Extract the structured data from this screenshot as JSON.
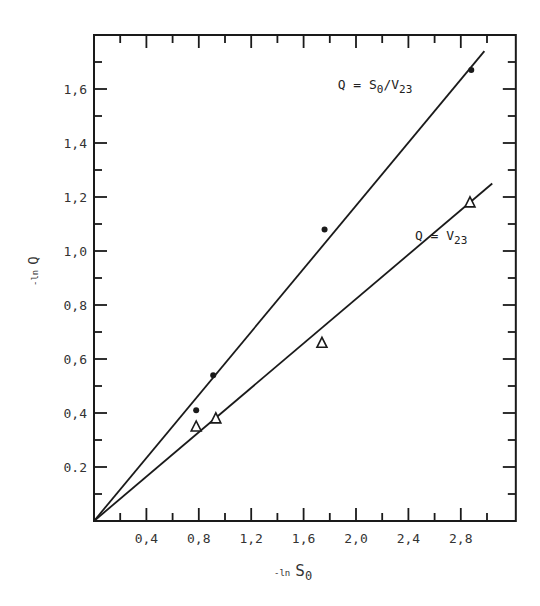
{
  "chart_data": {
    "type": "scatter",
    "title": "",
    "xlabel": "-ln S0",
    "ylabel": "-ln Q",
    "xlabel_parts": {
      "prefix": "-ln",
      "main": "S",
      "sub": "0"
    },
    "ylabel_parts": {
      "prefix": "-ln",
      "main": "Q"
    },
    "xlim": [
      0,
      3.22
    ],
    "ylim": [
      0,
      1.8
    ],
    "grid": false,
    "legend": "inline labels",
    "x_ticks": [
      0.4,
      0.8,
      1.2,
      1.6,
      2.0,
      2.4,
      2.8
    ],
    "x_tick_labels": [
      "0,4",
      "0,8",
      "1,2",
      "1,6",
      "2,0",
      "2,4",
      "2,8"
    ],
    "x_minor_ticks": [
      0.2,
      0.6,
      1.0,
      1.4,
      1.8,
      2.2,
      2.6,
      3.0
    ],
    "y_ticks": [
      0.2,
      0.4,
      0.6,
      0.8,
      1.0,
      1.2,
      1.4,
      1.6
    ],
    "y_tick_labels": [
      "0.2",
      "0,4",
      "0,6",
      "0,8",
      "1,0",
      "1,2",
      "1,4",
      "1,6"
    ],
    "y_minor_ticks": [
      0.1,
      0.3,
      0.5,
      0.7,
      0.9,
      1.1,
      1.3,
      1.5,
      1.7
    ],
    "series": [
      {
        "name": "Q = S0/V23",
        "label_parts": {
          "prefix": "Q = S",
          "sub1": "0",
          "mid": "/V",
          "sub2": "23"
        },
        "marker": "filled-circle",
        "x": [
          0.78,
          0.91,
          1.76,
          2.88
        ],
        "y": [
          0.41,
          0.54,
          1.08,
          1.67
        ],
        "fit_line": {
          "x": [
            0,
            2.98
          ],
          "y": [
            0,
            1.74
          ]
        },
        "label_pos": {
          "x": 1.86,
          "y": 1.6
        }
      },
      {
        "name": "Q = V23",
        "label_parts": {
          "prefix": "Q = V",
          "sub1": "",
          "mid": "",
          "sub2": "23"
        },
        "marker": "open-triangle",
        "x": [
          0.78,
          0.93,
          1.74,
          2.87
        ],
        "y": [
          0.35,
          0.38,
          0.66,
          1.18
        ],
        "fit_line": {
          "x": [
            0,
            3.04
          ],
          "y": [
            0,
            1.25
          ]
        },
        "label_pos": {
          "x": 2.45,
          "y": 1.04
        }
      }
    ]
  }
}
